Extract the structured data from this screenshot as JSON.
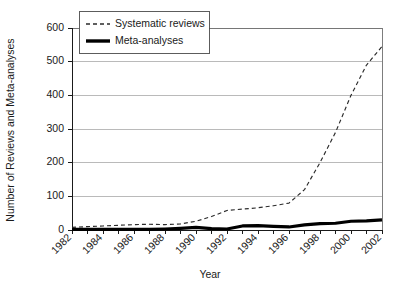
{
  "chart_data": {
    "type": "line",
    "title": "",
    "xlabel": "Year",
    "ylabel": "Number of Reviews and Meta-analyses",
    "xlim": [
      1982,
      2002
    ],
    "ylim": [
      0,
      600
    ],
    "grid": true,
    "legend_position": "top-left",
    "x": [
      1982,
      1983,
      1984,
      1985,
      1986,
      1987,
      1988,
      1989,
      1990,
      1991,
      1992,
      1993,
      1994,
      1995,
      1996,
      1997,
      1998,
      1999,
      2000,
      2001,
      2002
    ],
    "xtick_labels": [
      "1982",
      "1984",
      "1986",
      "1988",
      "1990",
      "1992",
      "1994",
      "1996",
      "1998",
      "2000",
      "2002"
    ],
    "ytick_labels": [
      "0",
      "100",
      "200",
      "300",
      "400",
      "500",
      "600"
    ],
    "ytick_values": [
      0,
      100,
      200,
      300,
      400,
      500,
      600
    ],
    "series": [
      {
        "name": "Systematic reviews",
        "style": "dashed",
        "color": "#2b2b2b",
        "values": [
          8,
          10,
          12,
          14,
          16,
          17,
          16,
          18,
          26,
          40,
          58,
          62,
          66,
          72,
          80,
          120,
          200,
          290,
          400,
          490,
          545
        ]
      },
      {
        "name": "Meta-analyses",
        "style": "solid",
        "color": "#000000",
        "values": [
          2,
          2,
          2,
          2,
          2,
          2,
          3,
          5,
          8,
          4,
          3,
          12,
          13,
          11,
          9,
          15,
          19,
          20,
          26,
          27,
          30
        ]
      }
    ]
  },
  "legend": {
    "entries": [
      {
        "label": "Systematic reviews",
        "style": "dashed"
      },
      {
        "label": "Meta-analyses",
        "style": "solid"
      }
    ]
  }
}
